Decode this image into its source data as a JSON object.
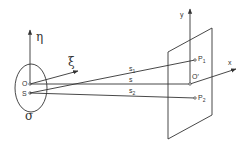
{
  "diagram": {
    "source_plane": {
      "label": "σ",
      "axes": {
        "vertical": "η",
        "horizontal": "ξ"
      },
      "points": {
        "origin": "O",
        "source": "S"
      }
    },
    "observation_plane": {
      "axes": {
        "vertical": "y",
        "horizontal": "x"
      },
      "points": {
        "origin": "O′",
        "p1": "P",
        "p1_sub": "1",
        "p2": "P",
        "p2_sub": "2"
      }
    },
    "rays": {
      "s1": {
        "label": "s",
        "sub": "1"
      },
      "s": {
        "label": "s"
      },
      "s2": {
        "label": "s",
        "sub": "2"
      }
    },
    "colors": {
      "stroke": "#333333",
      "background": "#ffffff"
    }
  }
}
